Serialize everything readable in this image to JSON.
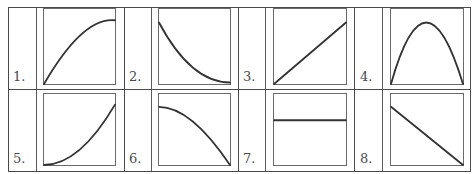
{
  "graphs": [
    {
      "label": "1.",
      "description": "increasing, concave down (rising then leveling off)",
      "curve": {
        "type": "quadratic-bezier",
        "points": [
          [
            0,
            0
          ],
          [
            0.55,
            0.9
          ],
          [
            1,
            0.85
          ]
        ]
      }
    },
    {
      "label": "2.",
      "description": "decreasing, concave up (falling then leveling off)",
      "curve": {
        "type": "quadratic-bezier",
        "points": [
          [
            0,
            0.82
          ],
          [
            0.45,
            0.02
          ],
          [
            1,
            0.02
          ]
        ]
      }
    },
    {
      "label": "3.",
      "description": "straight line increasing from origin",
      "curve": {
        "type": "line",
        "points": [
          [
            0,
            0
          ],
          [
            1,
            0.82
          ]
        ]
      }
    },
    {
      "label": "4.",
      "description": "inverted parabola (rises then falls)",
      "curve": {
        "type": "quadratic-bezier",
        "points": [
          [
            0,
            0
          ],
          [
            0.48,
            1.64
          ],
          [
            1,
            0
          ]
        ]
      }
    },
    {
      "label": "5.",
      "description": "increasing, concave up (slow then fast rise)",
      "curve": {
        "type": "quadratic-bezier",
        "points": [
          [
            0,
            0
          ],
          [
            0.5,
            0
          ],
          [
            1,
            0.85
          ]
        ]
      }
    },
    {
      "label": "6.",
      "description": "decreasing, concave down (slow then fast fall)",
      "curve": {
        "type": "quadratic-bezier",
        "points": [
          [
            0,
            0.82
          ],
          [
            0.45,
            0.82
          ],
          [
            1,
            0
          ]
        ]
      }
    },
    {
      "label": "7.",
      "description": "horizontal line (constant)",
      "curve": {
        "type": "line",
        "points": [
          [
            0,
            0.63
          ],
          [
            1,
            0.63
          ]
        ]
      }
    },
    {
      "label": "8.",
      "description": "straight line decreasing to zero",
      "curve": {
        "type": "line",
        "points": [
          [
            0,
            0.82
          ],
          [
            1,
            0
          ]
        ]
      }
    }
  ],
  "colors": {
    "curve": "#333333",
    "frame": "#6a6a6a",
    "grid": "#4a4a4a",
    "label": "#4a4a4a"
  }
}
